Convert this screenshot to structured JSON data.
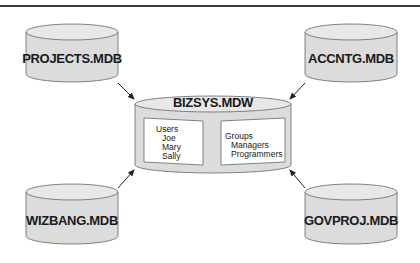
{
  "diagram": {
    "type": "database-relationship",
    "colors": {
      "cylinder_fill": "#dcdcdc",
      "cylinder_top": "#e8e8e8",
      "stroke": "#555555",
      "arrow": "#222222",
      "inner_box": "#ffffff",
      "top_rule": "#3a3a3a"
    },
    "center": {
      "label": "BIZSYS.MDW",
      "users_panel": {
        "heading": "Users",
        "items": [
          "Joe",
          "Mary",
          "Sally"
        ]
      },
      "groups_panel": {
        "heading": "Groups",
        "items": [
          "Managers",
          "Programmers"
        ]
      }
    },
    "databases": [
      {
        "id": "projects",
        "label": "PROJECTS.MDB",
        "position": "top-left"
      },
      {
        "id": "accntg",
        "label": "ACCNTG.MDB",
        "position": "top-right"
      },
      {
        "id": "wizbang",
        "label": "WIZBANG.MDB",
        "position": "bottom-left"
      },
      {
        "id": "govproj",
        "label": "GOVPROJ.MDB",
        "position": "bottom-right"
      }
    ],
    "edges": [
      {
        "from": "PROJECTS.MDB",
        "to": "BIZSYS.MDW"
      },
      {
        "from": "ACCNTG.MDB",
        "to": "BIZSYS.MDW"
      },
      {
        "from": "WIZBANG.MDB",
        "to": "BIZSYS.MDW"
      },
      {
        "from": "GOVPROJ.MDB",
        "to": "BIZSYS.MDW"
      }
    ]
  }
}
